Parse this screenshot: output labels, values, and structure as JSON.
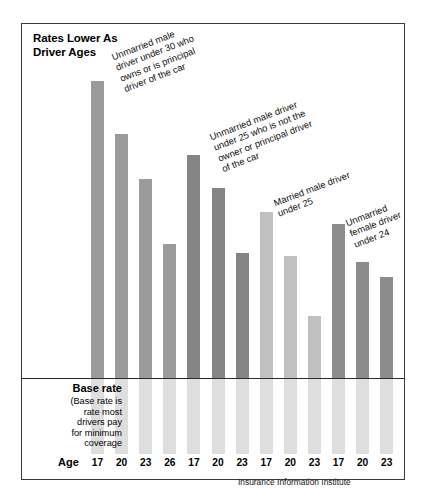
{
  "chart": {
    "title": "Rates Lower As\nDriver Ages",
    "axis_label": "Age",
    "source": "Insurance Information Institute",
    "base_rate_heading": "Base rate",
    "base_rate_note": "(Base rate is\nrate most\ndrivers pay\nfor minimum\ncoverage"
  },
  "annotations": [
    {
      "id": "anno-1",
      "text": "Unmarried male\ndriver under 30 who\nowns or is principal\ndriver of the car"
    },
    {
      "id": "anno-2",
      "text": "Unmarried male driver\nunder 25 who is not the\nowner or principal driver\nof the car"
    },
    {
      "id": "anno-3",
      "text": "Married male driver\nunder 25"
    },
    {
      "id": "anno-4",
      "text": "Unmarried\nfemale driver\nunder 24"
    }
  ],
  "chart_data": {
    "type": "bar",
    "title": "Rates Lower As Driver Ages",
    "xlabel": "Age",
    "ylabel": "",
    "grid": false,
    "legend": "none",
    "note": "Bars show relative auto insurance rate by driver age and category; a horizontal base-rate line marks the rate most drivers pay for minimum coverage. Bar values are index units above the base rate read off the plot.",
    "baseline_label": "Base rate",
    "categories": [
      "17",
      "20",
      "23",
      "26",
      "17",
      "20",
      "23",
      "17",
      "20",
      "23",
      "17",
      "20",
      "23"
    ],
    "groups": [
      {
        "name": "Unmarried male driver under 30 who owns or is principal driver of the car",
        "ages": [
          "17",
          "20",
          "23",
          "26"
        ],
        "values": [
          100,
          82,
          67,
          45
        ],
        "color": "#9b9b9b"
      },
      {
        "name": "Unmarried male driver under 25 who is not the owner or principal driver of the car",
        "ages": [
          "17",
          "20",
          "23"
        ],
        "values": [
          75,
          64,
          42
        ],
        "color": "#858585"
      },
      {
        "name": "Married male driver under 25",
        "ages": [
          "17",
          "20",
          "23"
        ],
        "values": [
          56,
          41,
          21
        ],
        "color": "#c0c0c0"
      },
      {
        "name": "Unmarried female driver under 24",
        "ages": [
          "17",
          "20",
          "23"
        ],
        "values": [
          52,
          39,
          34
        ],
        "color": "#8c8c8c"
      }
    ],
    "values": [
      100,
      82,
      67,
      45,
      75,
      64,
      42,
      56,
      41,
      21,
      52,
      39,
      34
    ],
    "ylim": [
      0,
      105
    ]
  }
}
